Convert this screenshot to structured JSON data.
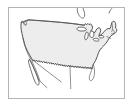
{
  "image": {
    "title": "United States Outline Map",
    "type": "map-thumbnail",
    "width": 133,
    "height": 107,
    "alt_text": "Outline map of the contiguous United States",
    "background_color": "#ffffff"
  },
  "frame": {
    "name": "map-border-frame",
    "border_color": "#b3b3b3",
    "border_width": 1,
    "inset_left": 8,
    "inset_top": 7,
    "frame_width": 117,
    "frame_height": 92
  },
  "map": {
    "region": "Contiguous United States",
    "projection_hint": "Albers-like conic",
    "land_fill_color": "#ededed",
    "outline_color": "#3c3c3c",
    "water_fill_color": "#ffffff",
    "neighbor_outline_color": "#555555",
    "features": [
      {
        "id": "conus-landmass",
        "label": "Contiguous United States",
        "kind": "landmass",
        "fill": "#ededed",
        "stroke": "#3c3c3c"
      },
      {
        "id": "northern-border",
        "label": "Canada border (49th parallel)",
        "kind": "border-line",
        "stroke": "#3c3c3c"
      },
      {
        "id": "great-lakes",
        "label": "Great Lakes",
        "kind": "water-body",
        "fill": "#ffffff",
        "stroke": "#444444"
      },
      {
        "id": "florida-peninsula",
        "label": "Florida Peninsula",
        "kind": "peninsula",
        "stroke": "#3c3c3c"
      },
      {
        "id": "baja-california",
        "label": "Baja California Peninsula",
        "kind": "peninsula",
        "fill": "#ffffff",
        "stroke": "#4a4a4a"
      },
      {
        "id": "gulf-of-california",
        "label": "Gulf of California",
        "kind": "water-body",
        "stroke": "#5a5a5a"
      },
      {
        "id": "puget-sound",
        "label": "Puget Sound / Olympic Peninsula",
        "kind": "coastal-notch",
        "stroke": "#3c3c3c"
      },
      {
        "id": "cape-cod",
        "label": "Cape Cod / New England coast",
        "kind": "coastal-notch",
        "stroke": "#3c3c3c"
      },
      {
        "id": "mexico-border",
        "label": "Mexico border / Rio Grande",
        "kind": "border-line",
        "stroke": "#5a5a5a"
      },
      {
        "id": "canada-outline",
        "label": "Southern Canada outline",
        "kind": "neighbor-outline",
        "stroke": "#555555"
      }
    ],
    "labels": []
  }
}
